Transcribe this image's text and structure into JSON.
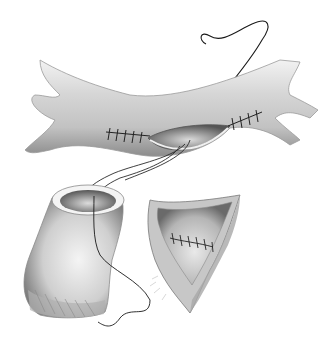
{
  "illustration": {
    "subject": "surgical vascular anastomosis drawing",
    "style": "grayscale pencil shading",
    "colors": {
      "background": "#ffffff",
      "vessel_light": "#e8e8e8",
      "vessel_mid": "#bdbdbd",
      "vessel_dark": "#6e6e6e",
      "suture": "#1a1a1a"
    },
    "elements": [
      "horizontal vessel with longitudinal incision",
      "interrupted sutures at both ends of incision",
      "curved suture needle with thread",
      "cylindrical graft cuff with open end",
      "opened vessel segment with sutured seam"
    ]
  }
}
